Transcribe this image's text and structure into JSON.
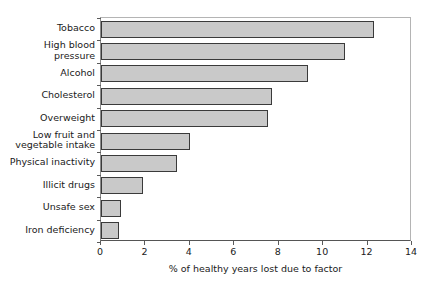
{
  "chart_data": {
    "type": "bar",
    "orientation": "horizontal",
    "title": "",
    "xlabel": "% of healthy years lost due to factor",
    "ylabel": "",
    "xlim": [
      0,
      14
    ],
    "xticks": [
      0,
      2,
      4,
      6,
      8,
      10,
      12,
      14
    ],
    "xtick_labels": [
      "0",
      "2",
      "4",
      "6",
      "8",
      "10",
      "12",
      "14"
    ],
    "grid": false,
    "legend": false,
    "categories": [
      "Tobacco",
      "High blood\npressure",
      "Alcohol",
      "Cholesterol",
      "Overweight",
      "Low fruit and\nvegetable intake",
      "Physical inactivity",
      "Illicit drugs",
      "Unsafe sex",
      "Iron deficiency"
    ],
    "values": [
      12.3,
      11.0,
      9.3,
      7.7,
      7.5,
      4.0,
      3.4,
      1.9,
      0.9,
      0.8
    ],
    "bar_color": "#c9c9c9",
    "bar_edge_color": "#3a3a3a",
    "axis_color": "#5a5a5a",
    "background_color": "#ffffff"
  }
}
